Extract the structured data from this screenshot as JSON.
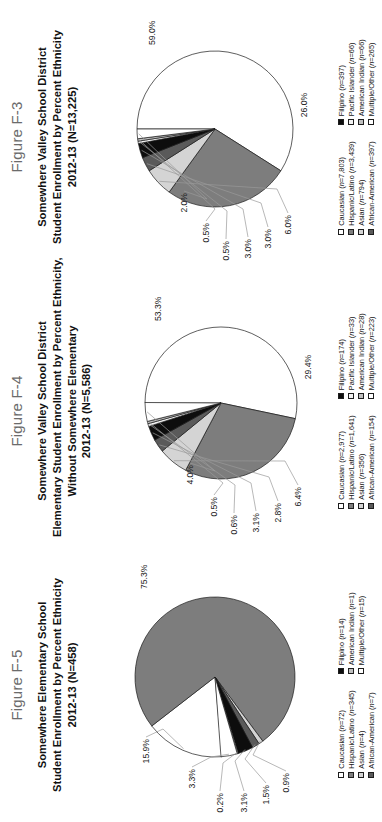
{
  "page": {
    "background": "#ffffff",
    "orientation": "landscape-rotated-90ccw"
  },
  "figures": [
    {
      "label": "Figure F-3",
      "title_lines": [
        "Somewhere Valley School District",
        "Student Enrollment by Percent Ethnicity",
        "2012-13 (N=13,225)"
      ],
      "legend_left": [
        {
          "label": "Caucasian (n=7,803)",
          "color": "#ffffff"
        },
        {
          "label": "Hispanic/Latino (n=3,439)",
          "color": "#7d7d7d"
        },
        {
          "label": "Asian (n=794)",
          "color": "#d4d4d4"
        },
        {
          "label": "African-American (n=397)",
          "color": "#5a5a5a"
        }
      ],
      "legend_right": [
        {
          "label": "Filipino (n=397)",
          "color": "#0d0d0d"
        },
        {
          "label": "Pacific Islander (n=66)",
          "color": "#f2f2f2"
        },
        {
          "label": "American Indian (n=66)",
          "color": "#bfbfbf"
        },
        {
          "label": "Multiple/Other (n=265)",
          "color": "#ffffff"
        }
      ],
      "chart_data": {
        "type": "pie",
        "title": "Somewhere Valley School District Student Enrollment by Percent Ethnicity 2012-13 (N=13,225)",
        "total_n": 13225,
        "legend_position": "bottom",
        "categories": [
          "Caucasian",
          "Hispanic/Latino",
          "Asian",
          "African-American",
          "Filipino",
          "Pacific Islander",
          "American Indian",
          "Multiple/Other"
        ],
        "counts": [
          7803,
          3439,
          794,
          397,
          397,
          66,
          66,
          265
        ],
        "values": [
          59.0,
          26.0,
          6.0,
          3.0,
          3.0,
          0.5,
          0.5,
          2.0
        ],
        "value_labels": [
          "59.0%",
          "26.0%",
          "6.0%",
          "3.0%",
          "3.0%",
          "0.5%",
          "0.5%",
          "2.0%"
        ],
        "colors": [
          "#ffffff",
          "#7d7d7d",
          "#d4d4d4",
          "#5a5a5a",
          "#0d0d0d",
          "#f2f2f2",
          "#bfbfbf",
          "#ffffff"
        ]
      }
    },
    {
      "label": "Figure F-4",
      "title_lines": [
        "Somewhere Valley School District",
        "Elementary Student Enrollment by Percent Ethnicity,",
        "Without Somewhere Elementary",
        "2012-13 (N=5,586)"
      ],
      "legend_left": [
        {
          "label": "Caucasian (n=2,977)",
          "color": "#ffffff"
        },
        {
          "label": "Hispanic/Latino (n=1,641)",
          "color": "#7d7d7d"
        },
        {
          "label": "Asian (n=356)",
          "color": "#d4d4d4"
        },
        {
          "label": "African-American (n=154)",
          "color": "#5a5a5a"
        }
      ],
      "legend_right": [
        {
          "label": "Filipino (n=174)",
          "color": "#0d0d0d"
        },
        {
          "label": "Pacific Islander (n=33)",
          "color": "#f2f2f2"
        },
        {
          "label": "American Indian (n=28)",
          "color": "#bfbfbf"
        },
        {
          "label": "Multiple/Other (n=223)",
          "color": "#ffffff"
        }
      ],
      "chart_data": {
        "type": "pie",
        "title": "Somewhere Valley School District Elementary Student Enrollment by Percent Ethnicity, Without Somewhere Elementary 2012-13 (N=5,586)",
        "total_n": 5586,
        "legend_position": "bottom",
        "categories": [
          "Caucasian",
          "Hispanic/Latino",
          "Asian",
          "African-American",
          "Filipino",
          "Pacific Islander",
          "American Indian",
          "Multiple/Other"
        ],
        "counts": [
          2977,
          1641,
          356,
          154,
          174,
          33,
          28,
          223
        ],
        "values": [
          53.3,
          29.4,
          6.4,
          2.8,
          3.1,
          0.6,
          0.5,
          4.0
        ],
        "value_labels": [
          "53.3%",
          "29.4%",
          "6.4%",
          "2.8%",
          "3.1%",
          "0.6%",
          "0.5%",
          "4.0%"
        ],
        "colors": [
          "#ffffff",
          "#7d7d7d",
          "#d4d4d4",
          "#5a5a5a",
          "#0d0d0d",
          "#f2f2f2",
          "#bfbfbf",
          "#ffffff"
        ]
      }
    },
    {
      "label": "Figure F-5",
      "title_lines": [
        "Somewhere Elementary School",
        "Student Enrollment by Percent Ethnicity",
        "2012-13 (N=458)"
      ],
      "legend_left": [
        {
          "label": "Caucasian (n=72)",
          "color": "#ffffff"
        },
        {
          "label": "Hispanic/Latino (n=345)",
          "color": "#7d7d7d"
        },
        {
          "label": "Asian (n=4)",
          "color": "#d4d4d4"
        },
        {
          "label": "African-American (n=7)",
          "color": "#5a5a5a"
        }
      ],
      "legend_right": [
        {
          "label": "Filipino (n=14)",
          "color": "#0d0d0d"
        },
        {
          "label": "American Indian (n=1)",
          "color": "#bfbfbf"
        },
        {
          "label": "Multiple/Other (n=15)",
          "color": "#ffffff"
        }
      ],
      "chart_data": {
        "type": "pie",
        "title": "Somewhere Elementary School Student Enrollment by Percent Ethnicity 2012-13 (N=458)",
        "total_n": 458,
        "legend_position": "bottom",
        "categories": [
          "Caucasian",
          "Hispanic/Latino",
          "Asian",
          "African-American",
          "Filipino",
          "American Indian",
          "Multiple/Other"
        ],
        "counts": [
          72,
          345,
          4,
          7,
          14,
          1,
          15
        ],
        "values": [
          15.9,
          75.3,
          0.9,
          1.5,
          3.1,
          0.2,
          3.3
        ],
        "value_labels": [
          "15.9%",
          "75.3%",
          "0.9%",
          "1.5%",
          "3.1%",
          "0.2%",
          "3.3%"
        ],
        "colors": [
          "#ffffff",
          "#7d7d7d",
          "#d4d4d4",
          "#5a5a5a",
          "#0d0d0d",
          "#bfbfbf",
          "#ffffff"
        ]
      }
    }
  ]
}
